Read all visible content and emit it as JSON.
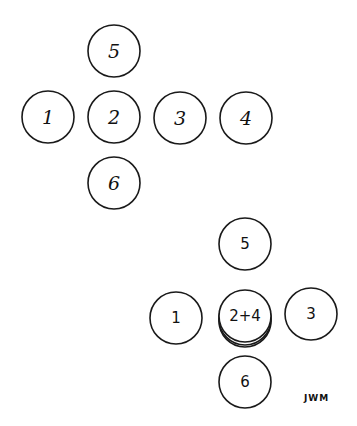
{
  "diagram": {
    "top_group": {
      "circles": [
        {
          "label": "5",
          "cx": 114,
          "cy": 51
        },
        {
          "label": "1",
          "cx": 48,
          "cy": 117
        },
        {
          "label": "2",
          "cx": 114,
          "cy": 117
        },
        {
          "label": "3",
          "cx": 180,
          "cy": 118
        },
        {
          "label": "4",
          "cx": 246,
          "cy": 118
        },
        {
          "label": "6",
          "cx": 114,
          "cy": 183
        }
      ]
    },
    "bottom_group": {
      "circles": [
        {
          "label": "5",
          "cx": 245,
          "cy": 244
        },
        {
          "label": "1",
          "cx": 176,
          "cy": 318
        },
        {
          "label": "2+4",
          "cx": 245,
          "cy": 317,
          "stacked": true
        },
        {
          "label": "3",
          "cx": 311,
          "cy": 314
        },
        {
          "label": "6",
          "cx": 245,
          "cy": 382
        }
      ]
    },
    "signature": "JWM"
  }
}
